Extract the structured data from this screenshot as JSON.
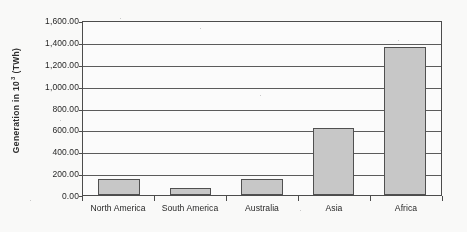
{
  "chart_data": {
    "type": "bar",
    "title": "",
    "subtitle": "",
    "xlabel": "",
    "ylabel": "Generation in 10³ (TWh)",
    "ylabel_base": "Generation in 10",
    "ylabel_exponent": "3",
    "ylabel_unit": "(TWh)",
    "categories": [
      "North America",
      "South America",
      "Australia",
      "Asia",
      "Africa"
    ],
    "values": [
      145,
      60,
      145,
      610,
      1350
    ],
    "ylim": [
      0,
      1600
    ],
    "ytick_step": 200,
    "ytick_labels": [
      "1,600.00",
      "1,400.00",
      "1,200.00",
      "1,000.00",
      "800.00",
      "600.00",
      "400.00",
      "200.00",
      "0.00"
    ],
    "ytick_values": [
      1600,
      1400,
      1200,
      1000,
      800,
      600,
      400,
      200,
      0
    ],
    "grid": "horizontal",
    "legend": "none",
    "series": [
      {
        "name": "Generation",
        "values": [
          145,
          60,
          145,
          610,
          1350
        ]
      }
    ],
    "colors": {
      "bar_fill": "#c9c9c9",
      "bar_border": "#4f4f4f",
      "gridline": "#5a5a5a",
      "axis": "#4a4a4a",
      "text": "#1f1f1f",
      "background": "#ffffff"
    }
  }
}
